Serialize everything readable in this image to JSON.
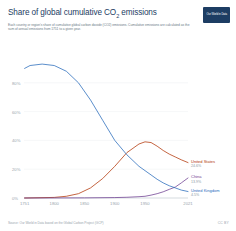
{
  "header": {
    "title_main": "Share of global cumulative CO",
    "title_sub": "2",
    "title_tail": " emissions",
    "subtitle": "Each country or region's share of cumulative global carbon dioxide (CO2) emissions. Cumulative emissions are calculated as the sum of annual emissions from 1751 to a given year.",
    "logo_text": "Our World in Data"
  },
  "footer": {
    "source": "Source: Our World in Data based on the Global Carbon Project (GCP)",
    "license": "CC BY"
  },
  "chart_data": {
    "type": "line",
    "title": "Share of global cumulative CO2 emissions",
    "xlabel": "",
    "ylabel": "",
    "xlim": [
      1750,
      2021
    ],
    "ylim": [
      0,
      100
    ],
    "ytick_values": [
      0,
      20,
      40,
      60,
      80
    ],
    "ytick_labels": [
      "0%",
      "20%",
      "40%",
      "60%",
      "80%"
    ],
    "xtick_values": [
      1751,
      1800,
      1850,
      1900,
      1950,
      2021
    ],
    "xtick_labels": [
      "1751",
      "1800",
      "1850",
      "1900",
      "1950",
      "2021"
    ],
    "grid": false,
    "legend_position": "right",
    "series": [
      {
        "name": "United States",
        "value_label": "24.6%",
        "color": "#b13507",
        "x": [
          1751,
          1800,
          1820,
          1840,
          1860,
          1880,
          1900,
          1920,
          1940,
          1950,
          1960,
          1970,
          1980,
          1990,
          2000,
          2010,
          2021
        ],
        "values": [
          0,
          0.4,
          1.2,
          3.0,
          7.0,
          13.5,
          22.0,
          31.5,
          37.5,
          39.0,
          38.5,
          36.0,
          33.0,
          30.5,
          28.5,
          26.5,
          24.6
        ]
      },
      {
        "name": "China",
        "value_label": "13.9%",
        "color": "#6d3e91",
        "x": [
          1751,
          1850,
          1900,
          1920,
          1940,
          1950,
          1960,
          1970,
          1980,
          1990,
          2000,
          2010,
          2021
        ],
        "values": [
          0,
          0.1,
          0.3,
          0.5,
          0.9,
          1.2,
          2.0,
          3.0,
          4.3,
          6.0,
          7.6,
          10.5,
          13.9
        ]
      },
      {
        "name": "United Kingdom",
        "value_label": "4.5%",
        "color": "#286bbb",
        "x": [
          1751,
          1760,
          1780,
          1800,
          1820,
          1840,
          1860,
          1880,
          1900,
          1920,
          1940,
          1950,
          1960,
          1970,
          1980,
          1990,
          2000,
          2010,
          2021
        ],
        "values": [
          90,
          92,
          93,
          92,
          88,
          80,
          68,
          54,
          40,
          30,
          22,
          19,
          16,
          13,
          10.5,
          8.5,
          7.0,
          5.5,
          4.5
        ]
      }
    ]
  }
}
